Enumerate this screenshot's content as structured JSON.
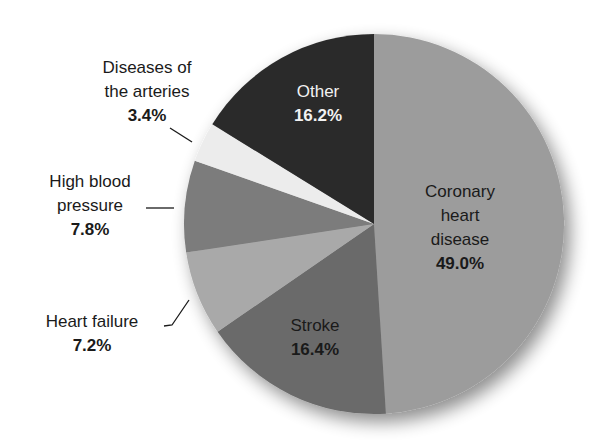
{
  "chart_data": {
    "type": "pie",
    "title": "",
    "start_angle_deg": 0,
    "direction": "clockwise",
    "slices": [
      {
        "label": "Coronary heart disease",
        "lines": [
          "Coronary",
          "heart",
          "disease"
        ],
        "value": 49.0,
        "pct_text": "49.0%",
        "color": "#9c9c9c"
      },
      {
        "label": "Stroke",
        "lines": [
          "Stroke"
        ],
        "value": 16.4,
        "pct_text": "16.4%",
        "color": "#6b6b6b"
      },
      {
        "label": "Heart failure",
        "lines": [
          "Heart failure"
        ],
        "value": 7.2,
        "pct_text": "7.2%",
        "color": "#a9a9a9"
      },
      {
        "label": "High blood pressure",
        "lines": [
          "High blood",
          "pressure"
        ],
        "value": 7.8,
        "pct_text": "7.8%",
        "color": "#7b7b7b"
      },
      {
        "label": "Diseases of the arteries",
        "lines": [
          "Diseases of",
          "the arteries"
        ],
        "value": 3.4,
        "pct_text": "3.4%",
        "color": "#ececec"
      },
      {
        "label": "Other",
        "lines": [
          "Other"
        ],
        "value": 16.2,
        "pct_text": "16.2%",
        "color": "#2b2b2b"
      }
    ]
  }
}
